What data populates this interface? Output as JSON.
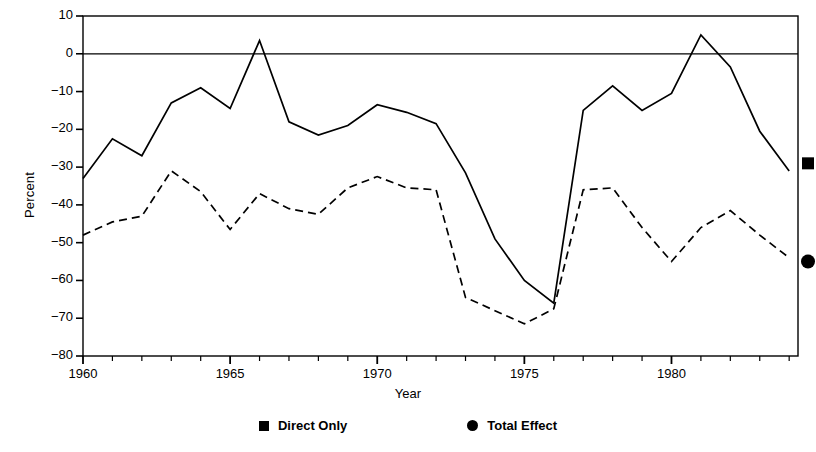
{
  "chart_data": {
    "type": "line",
    "title": "",
    "xlabel": "Year",
    "ylabel": "Percent",
    "xlim": [
      1960,
      1984.3
    ],
    "ylim": [
      -80,
      10
    ],
    "grid": false,
    "zero_line": true,
    "legend_position": "bottom",
    "x": [
      1960,
      1961,
      1962,
      1963,
      1964,
      1965,
      1966,
      1967,
      1968,
      1969,
      1970,
      1971,
      1972,
      1973,
      1974,
      1975,
      1976,
      1977,
      1978,
      1979,
      1980,
      1981,
      1982,
      1983,
      1984
    ],
    "xticks": [
      1960,
      1965,
      1970,
      1975,
      1980
    ],
    "xticklabels": [
      "1960",
      "1965",
      "1970",
      "1975",
      "1980"
    ],
    "yticks": [
      10,
      0,
      -10,
      -20,
      -30,
      -40,
      -50,
      -60,
      -70,
      -80
    ],
    "yticklabels": [
      "10",
      "0",
      "−10",
      "−20",
      "−30",
      "−40",
      "−50",
      "−60",
      "−70",
      "−80"
    ],
    "series": [
      {
        "name": "Direct Only",
        "style": "solid",
        "marker": "square",
        "end_marker_value": -29,
        "values": [
          -33,
          -22.5,
          -27,
          -13,
          -9,
          -14.5,
          3.5,
          -18,
          -21.5,
          -19,
          -13.5,
          -15.5,
          -18.5,
          -31.5,
          -49,
          -60,
          -66,
          -15,
          -8.5,
          -15,
          -10.5,
          5,
          -3.5,
          -20.5,
          -31
        ]
      },
      {
        "name": "Total Effect",
        "style": "dashed",
        "marker": "circle",
        "end_marker_value": -55,
        "values": [
          -48,
          -44.5,
          -43,
          -31,
          -36.5,
          -46.5,
          -37,
          -41,
          -42.5,
          -35.5,
          -32.5,
          -35.5,
          -36,
          -64.5,
          -68,
          -71.5,
          -67.5,
          -36,
          -35.5,
          -46,
          -55,
          -46,
          -41.5,
          -48,
          -54
        ]
      }
    ]
  },
  "legend": {
    "entries": [
      {
        "label": "Direct Only",
        "marker": "square-marker"
      },
      {
        "label": "Total Effect",
        "marker": "circle-marker"
      }
    ]
  }
}
